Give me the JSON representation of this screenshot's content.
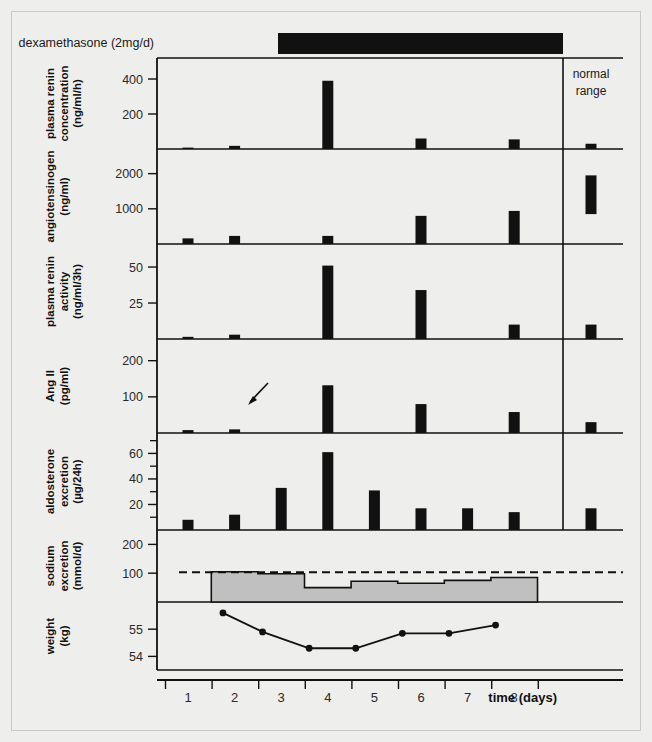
{
  "figure": {
    "treatment_label": "dexamethasone (2mg/d)",
    "normal_range_label_line1": "normal",
    "normal_range_label_line2": "range",
    "xaxis_title": "time (days)",
    "day_ticks": [
      "1",
      "2",
      "3",
      "4",
      "5",
      "6",
      "7",
      "8"
    ],
    "arrow_annotation": "arrow-marker",
    "colors": {
      "bar": "#111111",
      "treatment_bar": "#111111",
      "sodium_fill": "#c0c0c0",
      "axis": "#111111",
      "background": "#eeeeec",
      "panel": "#ffffff"
    }
  },
  "chart_data": [
    {
      "type": "bar",
      "panel": 1,
      "ylabel": "plasma renin concentration (ng/ml/h)",
      "ylabel_line1": "plasma renin",
      "ylabel_line2": "concentration",
      "ylabel_line3": "(ng/ml/h)",
      "ytick_labels": [
        "400",
        "200"
      ],
      "ytick_values": [
        400,
        200
      ],
      "ylim": [
        0,
        520
      ],
      "x": [
        1,
        2,
        3,
        4,
        5,
        6,
        7,
        8
      ],
      "categories": [
        "1",
        "2",
        "3",
        "4",
        "5",
        "6",
        "7",
        "8"
      ],
      "values": [
        8,
        18,
        0,
        390,
        0,
        60,
        0,
        55
      ],
      "normal_range_low": 0,
      "normal_range_high": 30
    },
    {
      "type": "bar",
      "panel": 2,
      "ylabel": "angiotensinogen (ng/ml)",
      "ylabel_line1": "angiotensinogen",
      "ylabel_line2": "(ng/ml)",
      "ytick_labels": [
        "2000",
        "1000"
      ],
      "ytick_values": [
        2000,
        1000
      ],
      "ylim": [
        0,
        2700
      ],
      "x": [
        1,
        2,
        3,
        4,
        5,
        6,
        7,
        8
      ],
      "categories": [
        "1",
        "2",
        "3",
        "4",
        "5",
        "6",
        "7",
        "8"
      ],
      "values": [
        160,
        230,
        0,
        230,
        0,
        800,
        0,
        940
      ],
      "normal_range_low": 850,
      "normal_range_high": 1950
    },
    {
      "type": "bar",
      "panel": 3,
      "ylabel": "plasma renin activity (ng/ml/3h)",
      "ylabel_line1": "plasma renin",
      "ylabel_line2": "activity",
      "ylabel_line3": "(ng/ml/3h)",
      "ytick_labels": [
        "50",
        "25"
      ],
      "ytick_values": [
        50,
        25
      ],
      "ylim": [
        0,
        66
      ],
      "x": [
        1,
        2,
        3,
        4,
        5,
        6,
        7,
        8
      ],
      "categories": [
        "1",
        "2",
        "3",
        "4",
        "5",
        "6",
        "7",
        "8"
      ],
      "values": [
        1.5,
        3.0,
        0,
        51,
        0,
        34,
        0,
        10
      ],
      "normal_range_low": 0,
      "normal_range_high": 10
    },
    {
      "type": "bar",
      "panel": 4,
      "ylabel": "Ang II (pg/ml)",
      "ylabel_line1": "Ang II",
      "ylabel_line2": "(pg/ml)",
      "ytick_labels": [
        "200",
        "100"
      ],
      "ytick_values": [
        200,
        100
      ],
      "ylim": [
        0,
        260
      ],
      "x": [
        1,
        2,
        3,
        4,
        5,
        6,
        7,
        8
      ],
      "categories": [
        "1",
        "2",
        "3",
        "4",
        "5",
        "6",
        "7",
        "8"
      ],
      "values": [
        8,
        10,
        0,
        132,
        0,
        80,
        0,
        58
      ],
      "normal_range_low": 0,
      "normal_range_high": 30,
      "annotation": "arrow pointing to baseline near day 3"
    },
    {
      "type": "bar",
      "panel": 5,
      "ylabel": "aldosterone excretion (µg/24h)",
      "ylabel_line1": "aldosterone",
      "ylabel_line2": "excretion",
      "ylabel_line3": "(µg/24h)",
      "ytick_labels": [
        "60",
        "40",
        "20"
      ],
      "ytick_values": [
        60,
        40,
        20
      ],
      "ylim": [
        0,
        76
      ],
      "x": [
        1,
        2,
        3,
        4,
        5,
        6,
        7,
        8
      ],
      "categories": [
        "1",
        "2",
        "3",
        "4",
        "5",
        "6",
        "7",
        "8"
      ],
      "values": [
        8,
        12,
        33,
        61,
        31,
        17,
        17,
        14
      ],
      "normal_range_low": 0,
      "normal_range_high": 17
    },
    {
      "type": "area",
      "panel": 6,
      "ylabel": "sodium excretion (mmol/d)",
      "ylabel_line1": "sodium",
      "ylabel_line2": "excretion",
      "ylabel_line3": "(mmol/d)",
      "ytick_labels": [
        "200",
        "100"
      ],
      "ytick_values": [
        200,
        100
      ],
      "ylim": [
        0,
        250
      ],
      "step_start_day": 1.5,
      "step_end_day": 8.5,
      "categories": [
        "2",
        "3",
        "4",
        "5",
        "6",
        "7",
        "8"
      ],
      "values": [
        105,
        98,
        50,
        72,
        65,
        75,
        85
      ],
      "reference_line_value": 103,
      "reference_line_style": "dashed"
    },
    {
      "type": "line",
      "panel": 7,
      "ylabel": "weight (kg)",
      "ylabel_line1": "weight",
      "ylabel_line2": "(kg)",
      "ytick_labels": [
        "55",
        "54"
      ],
      "ytick_values": [
        55,
        54
      ],
      "ylim": [
        53.5,
        56.0
      ],
      "x": [
        1.75,
        2.6,
        3.6,
        4.6,
        5.6,
        6.6,
        7.6
      ],
      "categories": [
        "2",
        "3",
        "4",
        "5",
        "6",
        "7",
        "8"
      ],
      "values": [
        55.6,
        54.9,
        54.3,
        54.3,
        54.85,
        54.85,
        55.15
      ]
    }
  ]
}
